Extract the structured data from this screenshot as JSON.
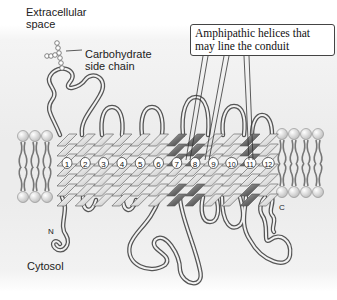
{
  "diagram": {
    "type": "membrane-protein-topology",
    "labels": {
      "extracellular": "Extracellular space",
      "carbohydrate": "Carbohydrate side chain",
      "cytosol": "Cytosol",
      "n_terminus": "N",
      "c_terminus": "C",
      "callout": "Amphipathic helices that may line the conduit"
    },
    "helices": [
      {
        "num": "1",
        "amphipathic": false
      },
      {
        "num": "2",
        "amphipathic": false
      },
      {
        "num": "3",
        "amphipathic": false
      },
      {
        "num": "4",
        "amphipathic": false
      },
      {
        "num": "5",
        "amphipathic": false
      },
      {
        "num": "6",
        "amphipathic": false
      },
      {
        "num": "7",
        "amphipathic": true
      },
      {
        "num": "8",
        "amphipathic": true
      },
      {
        "num": "9",
        "amphipathic": false
      },
      {
        "num": "10",
        "amphipathic": false
      },
      {
        "num": "11",
        "amphipathic": true
      },
      {
        "num": "12",
        "amphipathic": false
      }
    ],
    "colors": {
      "helix_light": "#e6e6e6",
      "helix_dark": "#6a6a6a",
      "lipid_head": "#d8d8d8",
      "lipid_tail": "#7a7a7a",
      "loop_stroke": "#555555"
    }
  }
}
